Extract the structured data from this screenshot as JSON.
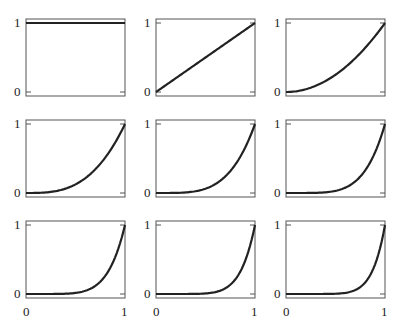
{
  "chart_data": [
    {
      "type": "line",
      "title": "",
      "function": "y = x^0",
      "xlim": [
        0,
        1
      ],
      "ylim": [
        0,
        1
      ],
      "xticks": [
        "0",
        "1"
      ],
      "yticks": [
        "0",
        "1"
      ],
      "x": [
        0,
        0.25,
        0.5,
        0.75,
        1
      ],
      "values": [
        1,
        1,
        1,
        1,
        1
      ]
    },
    {
      "type": "line",
      "title": "",
      "function": "y = x^1",
      "xlim": [
        0,
        1
      ],
      "ylim": [
        0,
        1
      ],
      "xticks": [
        "0",
        "1"
      ],
      "yticks": [
        "0",
        "1"
      ],
      "x": [
        0,
        0.25,
        0.5,
        0.75,
        1
      ],
      "values": [
        0,
        0.25,
        0.5,
        0.75,
        1
      ]
    },
    {
      "type": "line",
      "title": "",
      "function": "y = x^2",
      "xlim": [
        0,
        1
      ],
      "ylim": [
        0,
        1
      ],
      "xticks": [
        "0",
        "1"
      ],
      "yticks": [
        "0",
        "1"
      ],
      "x": [
        0,
        0.25,
        0.5,
        0.75,
        1
      ],
      "values": [
        0,
        0.0625,
        0.25,
        0.5625,
        1
      ]
    },
    {
      "type": "line",
      "title": "",
      "function": "y = x^3",
      "xlim": [
        0,
        1
      ],
      "ylim": [
        0,
        1
      ],
      "xticks": [
        "0",
        "1"
      ],
      "yticks": [
        "0",
        "1"
      ],
      "x": [
        0,
        0.25,
        0.5,
        0.75,
        1
      ],
      "values": [
        0,
        0.016,
        0.125,
        0.422,
        1
      ]
    },
    {
      "type": "line",
      "title": "",
      "function": "y = x^4",
      "xlim": [
        0,
        1
      ],
      "ylim": [
        0,
        1
      ],
      "xticks": [
        "0",
        "1"
      ],
      "yticks": [
        "0",
        "1"
      ],
      "x": [
        0,
        0.25,
        0.5,
        0.75,
        1
      ],
      "values": [
        0,
        0.004,
        0.0625,
        0.316,
        1
      ]
    },
    {
      "type": "line",
      "title": "",
      "function": "y = x^5",
      "xlim": [
        0,
        1
      ],
      "ylim": [
        0,
        1
      ],
      "xticks": [
        "0",
        "1"
      ],
      "yticks": [
        "0",
        "1"
      ],
      "x": [
        0,
        0.25,
        0.5,
        0.75,
        1
      ],
      "values": [
        0,
        0.001,
        0.031,
        0.237,
        1
      ]
    },
    {
      "type": "line",
      "title": "",
      "function": "y = x^6",
      "xlim": [
        0,
        1
      ],
      "ylim": [
        0,
        1
      ],
      "xticks": [
        "0",
        "1"
      ],
      "yticks": [
        "0",
        "1"
      ],
      "x": [
        0,
        0.25,
        0.5,
        0.75,
        1
      ],
      "values": [
        0,
        0.0002,
        0.016,
        0.178,
        1
      ]
    },
    {
      "type": "line",
      "title": "",
      "function": "y = x^7",
      "xlim": [
        0,
        1
      ],
      "ylim": [
        0,
        1
      ],
      "xticks": [
        "0",
        "1"
      ],
      "yticks": [
        "0",
        "1"
      ],
      "x": [
        0,
        0.25,
        0.5,
        0.75,
        1
      ],
      "values": [
        0,
        0.0001,
        0.008,
        0.133,
        1
      ]
    },
    {
      "type": "line",
      "title": "",
      "function": "y = x^8",
      "xlim": [
        0,
        1
      ],
      "ylim": [
        0,
        1
      ],
      "xticks": [
        "0",
        "1"
      ],
      "yticks": [
        "0",
        "1"
      ],
      "x": [
        0,
        0.25,
        0.5,
        0.75,
        1
      ],
      "values": [
        0,
        2e-05,
        0.004,
        0.1,
        1
      ]
    }
  ],
  "grid": {
    "rows": 3,
    "cols": 3,
    "exponents": [
      0,
      1,
      2,
      3,
      4,
      5,
      6,
      7,
      8
    ]
  },
  "labels": {
    "y_top": "1",
    "y_bottom": "0",
    "x_left": "0",
    "x_right": "1"
  },
  "colors": {
    "curve": "#222222",
    "frame": "#555555"
  }
}
